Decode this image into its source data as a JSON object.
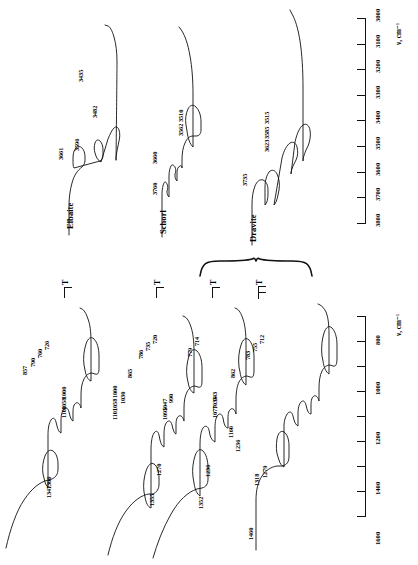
{
  "figure": {
    "type": "ir-spectra",
    "orientation": "rotated-90",
    "axis_label": "ν, cm⁻¹",
    "intensity_label": "T"
  },
  "top_panel": {
    "axis": {
      "label": "ν, cm⁻¹",
      "ticks": [
        "3800",
        "3700",
        "3600",
        "3500",
        "3400",
        "3300",
        "3200",
        "3100",
        "3000"
      ],
      "min": 3000,
      "max": 3800,
      "step": 100
    },
    "spectra": [
      {
        "name": "Elbaite",
        "peaks": [
          "3661",
          "3596",
          "3482",
          "3435"
        ]
      },
      {
        "name": "Schorl",
        "peaks": [
          "3760",
          "3660",
          "3562",
          "3510"
        ]
      },
      {
        "name": "Dravite",
        "peaks": [
          "3735",
          "3623",
          "3585",
          "3515"
        ]
      }
    ]
  },
  "bottom_panel": {
    "axis": {
      "label": "ν, cm⁻¹",
      "ticks": [
        "1600",
        "1400",
        "1200",
        "1000",
        "800"
      ],
      "min": 600,
      "max": 1600,
      "step": 200
    },
    "spectra": [
      {
        "name": "trace-1",
        "peaks": [
          "1347",
          "1306",
          "1101",
          "1058",
          "1000",
          "857",
          "790",
          "760",
          "726"
        ]
      },
      {
        "name": "trace-2",
        "peaks": [
          "1355",
          "1270",
          "1101",
          "1058",
          "1030",
          "1000",
          "865",
          "786",
          "735",
          "720"
        ]
      },
      {
        "name": "trace-3",
        "peaks": [
          "1352",
          "1236",
          "1095",
          "1047",
          "990",
          "779",
          "714"
        ]
      },
      {
        "name": "trace-4",
        "peaks": [
          "1460",
          "1352",
          "1318",
          "1279",
          "1236",
          "1160",
          "1077",
          "1035",
          "943",
          "862",
          "783",
          "755",
          "712"
        ]
      }
    ]
  },
  "markers": {
    "t_label": "T",
    "count": 4
  },
  "colors": {
    "ink": "#111111",
    "background": "#ffffff"
  }
}
